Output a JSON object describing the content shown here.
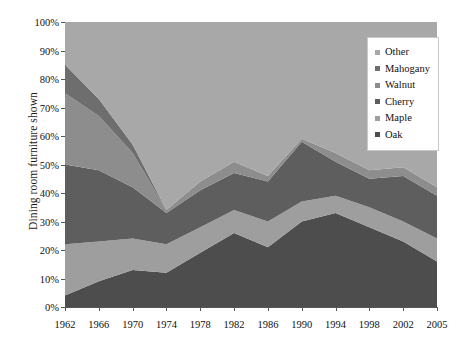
{
  "chart_data": {
    "type": "area",
    "stacked": true,
    "title": "",
    "subtitle": "",
    "xlabel": "",
    "ylabel": "Dining room furniture shown",
    "categories": [
      "1962",
      "1966",
      "1970",
      "1974",
      "1978",
      "1982",
      "1986",
      "1990",
      "1994",
      "1998",
      "2002",
      "2005"
    ],
    "x_tick_labels": [
      "1962",
      "1966",
      "1970",
      "1974",
      "1978",
      "1982",
      "1986",
      "1990",
      "1994",
      "1998",
      "2002",
      "2005"
    ],
    "y_tick_labels": [
      "0%",
      "10%",
      "20%",
      "30%",
      "40%",
      "50%",
      "60%",
      "70%",
      "80%",
      "90%",
      "100%"
    ],
    "y_tick_values": [
      0,
      10,
      20,
      30,
      40,
      50,
      60,
      70,
      80,
      90,
      100
    ],
    "ylim": [
      0,
      100
    ],
    "y_unit": "%",
    "grid": false,
    "legend_position": "top-right",
    "series": [
      {
        "name": "Oak",
        "color": "#4d4d4d",
        "values": [
          4,
          9,
          13,
          12,
          19,
          26,
          21,
          30,
          33,
          28,
          23,
          16
        ]
      },
      {
        "name": "Maple",
        "color": "#9e9e9e",
        "values": [
          18,
          14,
          11,
          10,
          9,
          8,
          9,
          7,
          6,
          7,
          7,
          8
        ]
      },
      {
        "name": "Cherry",
        "color": "#5e5e5e",
        "values": [
          28,
          25,
          18,
          11,
          13,
          13,
          14,
          21,
          12,
          10,
          16,
          15
        ]
      },
      {
        "name": "Walnut",
        "color": "#8d8d8d",
        "values": [
          25,
          19,
          12,
          1,
          3,
          4,
          2,
          1,
          3,
          3,
          3,
          3
        ]
      },
      {
        "name": "Mahogany",
        "color": "#6e6e6e",
        "values": [
          10,
          6,
          3,
          0,
          0,
          0,
          0,
          0,
          0,
          0,
          0,
          0
        ]
      },
      {
        "name": "Other",
        "color": "#a8a8a8",
        "values": [
          15,
          27,
          43,
          66,
          56,
          49,
          54,
          41,
          46,
          52,
          51,
          58
        ]
      }
    ],
    "stack_order_bottom_to_top": [
      "Oak",
      "Maple",
      "Cherry",
      "Walnut",
      "Mahogany",
      "Other"
    ],
    "legend_order_top_to_bottom": [
      "Other",
      "Mahogany",
      "Walnut",
      "Cherry",
      "Maple",
      "Oak"
    ],
    "colors": {
      "oak": "#4d4d4d",
      "maple": "#9e9e9e",
      "cherry": "#5e5e5e",
      "walnut": "#8d8d8d",
      "mahogany": "#6e6e6e",
      "other": "#a8a8a8",
      "axis": "#555555",
      "text": "#111111",
      "legend_border": "#c9c9c9",
      "background": "#ffffff"
    }
  },
  "legend": {
    "items": [
      {
        "label": "Other"
      },
      {
        "label": "Mahogany"
      },
      {
        "label": "Walnut"
      },
      {
        "label": "Cherry"
      },
      {
        "label": "Maple"
      },
      {
        "label": "Oak"
      }
    ]
  }
}
